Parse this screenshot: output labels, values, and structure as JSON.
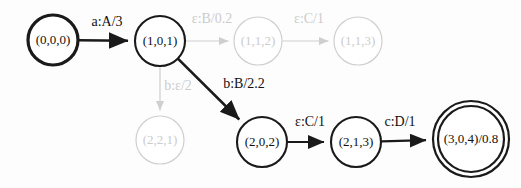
{
  "figure": {
    "kind": "weighted-finite-state-transducer-diagram",
    "colors": {
      "active_stroke": "#1a1a1a",
      "faded_stroke": "#cfcfcf",
      "active_text": "#111111",
      "faded_text": "#cccccc",
      "background": "#fdfdfd"
    }
  },
  "nodes": [
    {
      "id": "n0",
      "label": "(0,0,0)",
      "cx": 53,
      "cy": 40,
      "r": 25,
      "style": "start",
      "stroke_width": 3.2,
      "faded": false,
      "font_size": 13
    },
    {
      "id": "n1",
      "label": "(1,0,1)",
      "cx": 160,
      "cy": 41,
      "r": 25,
      "style": "normal",
      "stroke_width": 2.1,
      "faded": false,
      "font_size": 13
    },
    {
      "id": "n2",
      "label": "(1,1,2)",
      "cx": 258,
      "cy": 41,
      "r": 24,
      "style": "normal",
      "stroke_width": 1.2,
      "faded": true,
      "font_size": 13
    },
    {
      "id": "n3",
      "label": "(1,1,3)",
      "cx": 358,
      "cy": 41,
      "r": 24,
      "style": "normal",
      "stroke_width": 1.2,
      "faded": true,
      "font_size": 13
    },
    {
      "id": "n4",
      "label": "(2,2,1)",
      "cx": 160,
      "cy": 140,
      "r": 24,
      "style": "normal",
      "stroke_width": 1.2,
      "faded": true,
      "font_size": 13
    },
    {
      "id": "n5",
      "label": "(2,0,2)",
      "cx": 262,
      "cy": 142,
      "r": 25,
      "style": "normal",
      "stroke_width": 2.1,
      "faded": false,
      "font_size": 13
    },
    {
      "id": "n6",
      "label": "(2,1,3)",
      "cx": 356,
      "cy": 142,
      "r": 25,
      "style": "normal",
      "stroke_width": 2.1,
      "faded": false,
      "font_size": 13
    },
    {
      "id": "n7",
      "label": "(3,0,4)/0.8",
      "cx": 471,
      "cy": 139,
      "r": 38,
      "r_inner": 33,
      "style": "final",
      "stroke_width": 2.2,
      "faded": false,
      "font_size": 13
    }
  ],
  "edges": [
    {
      "id": "e0",
      "from": "n0",
      "to": "n1",
      "label": "a:A/3",
      "label_x": 107,
      "label_y": 23,
      "faded": false,
      "stroke_width": 2.6,
      "font_size": 14
    },
    {
      "id": "e1",
      "from": "n1",
      "to": "n2",
      "label": "ε:B/0.2",
      "label_x": 212,
      "label_y": 20,
      "faded": true,
      "stroke_width": 1.2,
      "font_size": 14
    },
    {
      "id": "e2",
      "from": "n2",
      "to": "n3",
      "label": "ε:C/1",
      "label_x": 309,
      "label_y": 20,
      "faded": true,
      "stroke_width": 1.2,
      "font_size": 14
    },
    {
      "id": "e3",
      "from": "n1",
      "to": "n4",
      "label": "b:ε/2",
      "label_x": 178,
      "label_y": 87,
      "faded": true,
      "stroke_width": 1.2,
      "font_size": 14
    },
    {
      "id": "e4",
      "from": "n1",
      "to": "n5",
      "label": "b:B/2.2",
      "label_x": 244,
      "label_y": 85,
      "faded": false,
      "stroke_width": 2.6,
      "font_size": 14
    },
    {
      "id": "e5",
      "from": "n5",
      "to": "n6",
      "label": "ε:C/1",
      "label_x": 310,
      "label_y": 123,
      "faded": false,
      "stroke_width": 2.2,
      "font_size": 14
    },
    {
      "id": "e6",
      "from": "n6",
      "to": "n7",
      "label": "c:D/1",
      "label_x": 400,
      "label_y": 123,
      "faded": false,
      "stroke_width": 2.2,
      "font_size": 14
    }
  ]
}
